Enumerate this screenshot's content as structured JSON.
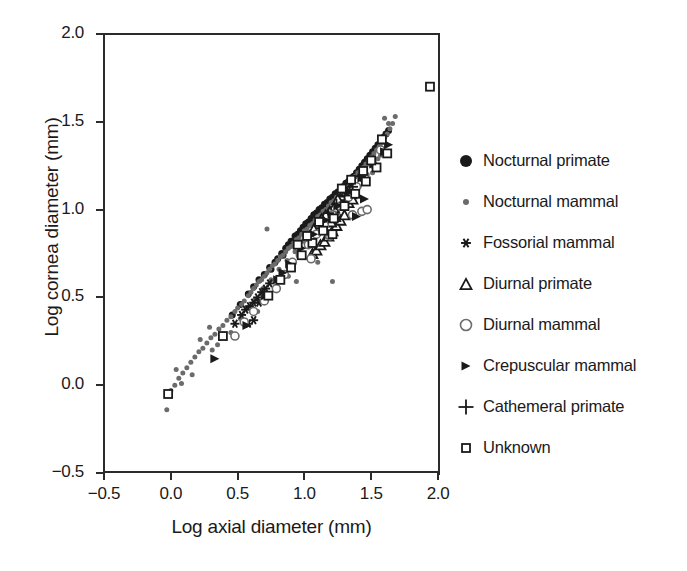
{
  "chart_data": {
    "type": "scatter",
    "title": "",
    "xlabel": "Log axial diameter (mm)",
    "ylabel": "Log cornea diameter (mm)",
    "xlim": [
      -0.5,
      2.0
    ],
    "ylim": [
      -0.5,
      2.0
    ],
    "xticks": [
      "-0.5",
      "0.0",
      "0.5",
      "1.0",
      "1.5",
      "2.0"
    ],
    "xtick_values": [
      -0.5,
      0.0,
      0.5,
      1.0,
      1.5,
      2.0
    ],
    "yticks": [
      "-0.5",
      "0.0",
      "0.5",
      "1.0",
      "1.5",
      "2.0"
    ],
    "ytick_values": [
      -0.5,
      0.0,
      0.5,
      1.0,
      1.5,
      2.0
    ],
    "grid": false,
    "legend_position": "right",
    "series": [
      {
        "name": "Nocturnal primate",
        "marker": "filled-circle",
        "color": "#1a1a1a",
        "size": 7,
        "points": [
          [
            0.46,
            0.4
          ],
          [
            0.52,
            0.46
          ],
          [
            0.58,
            0.52
          ],
          [
            0.62,
            0.56
          ],
          [
            0.66,
            0.6
          ],
          [
            0.7,
            0.63
          ],
          [
            0.74,
            0.67
          ],
          [
            0.78,
            0.7
          ],
          [
            0.8,
            0.72
          ],
          [
            0.83,
            0.75
          ],
          [
            0.86,
            0.78
          ],
          [
            0.88,
            0.8
          ],
          [
            0.9,
            0.82
          ],
          [
            0.93,
            0.85
          ],
          [
            0.95,
            0.86
          ],
          [
            0.97,
            0.88
          ],
          [
            0.99,
            0.9
          ],
          [
            1.01,
            0.92
          ],
          [
            1.03,
            0.93
          ],
          [
            1.05,
            0.95
          ],
          [
            1.07,
            0.97
          ],
          [
            1.09,
            0.98
          ],
          [
            1.11,
            1.0
          ],
          [
            1.13,
            1.01
          ],
          [
            1.15,
            1.03
          ],
          [
            1.17,
            1.04
          ],
          [
            1.19,
            1.06
          ],
          [
            1.21,
            1.07
          ],
          [
            1.23,
            1.09
          ],
          [
            1.25,
            1.1
          ],
          [
            1.27,
            1.12
          ],
          [
            1.29,
            1.13
          ],
          [
            1.31,
            1.15
          ],
          [
            1.33,
            1.16
          ],
          [
            1.35,
            1.18
          ],
          [
            1.37,
            1.19
          ],
          [
            1.39,
            1.21
          ],
          [
            1.41,
            1.23
          ],
          [
            1.43,
            1.25
          ],
          [
            1.45,
            1.27
          ],
          [
            1.47,
            1.29
          ],
          [
            1.49,
            1.31
          ],
          [
            1.51,
            1.33
          ],
          [
            1.53,
            1.35
          ],
          [
            1.55,
            1.37
          ],
          [
            1.57,
            1.39
          ],
          [
            1.59,
            1.41
          ],
          [
            1.61,
            1.43
          ],
          [
            1.63,
            1.45
          ],
          [
            1.12,
            0.95
          ],
          [
            1.18,
            1.0
          ],
          [
            1.24,
            1.05
          ],
          [
            1.3,
            1.1
          ],
          [
            1.36,
            1.14
          ],
          [
            1.42,
            1.2
          ],
          [
            0.75,
            0.66
          ],
          [
            0.84,
            0.74
          ],
          [
            0.92,
            0.81
          ],
          [
            1.0,
            0.89
          ],
          [
            1.08,
            0.96
          ]
        ]
      },
      {
        "name": "Nocturnal mammal",
        "marker": "small-filled-circle",
        "color": "#6b6b6b",
        "size": 5,
        "points": [
          [
            -0.03,
            -0.14
          ],
          [
            -0.02,
            -0.06
          ],
          [
            0.0,
            -0.03
          ],
          [
            0.03,
            0.0
          ],
          [
            0.06,
            0.04
          ],
          [
            0.09,
            0.07
          ],
          [
            0.12,
            0.1
          ],
          [
            0.15,
            0.13
          ],
          [
            0.18,
            0.16
          ],
          [
            0.21,
            0.19
          ],
          [
            0.24,
            0.21
          ],
          [
            0.27,
            0.24
          ],
          [
            0.3,
            0.27
          ],
          [
            0.33,
            0.29
          ],
          [
            0.36,
            0.32
          ],
          [
            0.39,
            0.34
          ],
          [
            0.42,
            0.37
          ],
          [
            0.45,
            0.39
          ],
          [
            0.48,
            0.42
          ],
          [
            0.5,
            0.44
          ],
          [
            0.53,
            0.46
          ],
          [
            0.55,
            0.48
          ],
          [
            0.58,
            0.51
          ],
          [
            0.6,
            0.53
          ],
          [
            0.62,
            0.55
          ],
          [
            0.64,
            0.57
          ],
          [
            0.66,
            0.59
          ],
          [
            0.68,
            0.6
          ],
          [
            0.7,
            0.62
          ],
          [
            0.72,
            0.64
          ],
          [
            0.74,
            0.66
          ],
          [
            0.76,
            0.68
          ],
          [
            0.78,
            0.69
          ],
          [
            0.8,
            0.71
          ],
          [
            0.82,
            0.73
          ],
          [
            0.84,
            0.74
          ],
          [
            0.86,
            0.76
          ],
          [
            0.88,
            0.78
          ],
          [
            0.9,
            0.79
          ],
          [
            0.92,
            0.81
          ],
          [
            0.94,
            0.83
          ],
          [
            0.96,
            0.84
          ],
          [
            0.98,
            0.86
          ],
          [
            1.0,
            0.88
          ],
          [
            1.02,
            0.89
          ],
          [
            1.04,
            0.91
          ],
          [
            1.06,
            0.92
          ],
          [
            1.08,
            0.94
          ],
          [
            1.1,
            0.96
          ],
          [
            1.12,
            0.97
          ],
          [
            1.14,
            0.99
          ],
          [
            1.16,
            1.0
          ],
          [
            1.18,
            1.02
          ],
          [
            1.2,
            1.04
          ],
          [
            1.22,
            1.05
          ],
          [
            1.24,
            1.07
          ],
          [
            1.26,
            1.08
          ],
          [
            1.28,
            1.1
          ],
          [
            1.3,
            1.12
          ],
          [
            1.32,
            1.13
          ],
          [
            1.34,
            1.15
          ],
          [
            1.36,
            1.17
          ],
          [
            1.38,
            1.19
          ],
          [
            1.4,
            1.21
          ],
          [
            1.42,
            1.22
          ],
          [
            1.44,
            1.24
          ],
          [
            1.46,
            1.26
          ],
          [
            1.48,
            1.28
          ],
          [
            1.5,
            1.3
          ],
          [
            1.52,
            1.32
          ],
          [
            1.54,
            1.34
          ],
          [
            1.56,
            1.36
          ],
          [
            1.58,
            1.38
          ],
          [
            1.6,
            1.41
          ],
          [
            1.62,
            1.43
          ],
          [
            1.64,
            1.46
          ],
          [
            1.66,
            1.49
          ],
          [
            1.68,
            1.53
          ],
          [
            1.6,
            1.52
          ],
          [
            1.63,
            1.49
          ],
          [
            0.31,
            0.2
          ],
          [
            0.35,
            0.23
          ],
          [
            0.45,
            0.3
          ],
          [
            0.52,
            0.38
          ],
          [
            0.57,
            0.44
          ],
          [
            0.63,
            0.49
          ],
          [
            0.69,
            0.55
          ],
          [
            0.75,
            0.6
          ],
          [
            0.81,
            0.66
          ],
          [
            0.87,
            0.71
          ],
          [
            0.93,
            0.76
          ],
          [
            0.99,
            0.82
          ],
          [
            1.05,
            0.87
          ],
          [
            1.11,
            0.92
          ],
          [
            1.17,
            0.97
          ],
          [
            0.72,
            0.89
          ],
          [
            0.88,
            0.62
          ],
          [
            0.94,
            0.59
          ],
          [
            1.21,
            0.59
          ],
          [
            1.33,
            1.05
          ],
          [
            1.41,
            1.13
          ],
          [
            1.47,
            1.2
          ],
          [
            1.55,
            1.29
          ],
          [
            1.1,
            0.7
          ],
          [
            0.65,
            0.42
          ],
          [
            0.29,
            0.33
          ],
          [
            0.22,
            0.26
          ],
          [
            0.16,
            0.06
          ],
          [
            0.08,
            0.01
          ],
          [
            0.04,
            0.09
          ],
          [
            1.51,
            1.21
          ],
          [
            1.57,
            1.31
          ],
          [
            1.35,
            1.09
          ],
          [
            1.25,
            0.98
          ],
          [
            1.15,
            0.89
          ]
        ]
      },
      {
        "name": "Fossorial mammal",
        "marker": "asterisk",
        "color": "#1a1a1a",
        "size": 9,
        "points": [
          [
            0.53,
            0.4
          ],
          [
            0.56,
            0.43
          ],
          [
            0.59,
            0.45
          ],
          [
            0.62,
            0.47
          ],
          [
            0.65,
            0.5
          ],
          [
            0.68,
            0.53
          ],
          [
            0.71,
            0.55
          ],
          [
            0.62,
            0.37
          ],
          [
            0.58,
            0.35
          ],
          [
            0.48,
            0.35
          ],
          [
            0.74,
            0.58
          ],
          [
            0.66,
            0.47
          ]
        ]
      },
      {
        "name": "Diurnal primate",
        "marker": "open-triangle",
        "color": "#1a1a1a",
        "size": 10,
        "points": [
          [
            1.06,
            0.75
          ],
          [
            1.09,
            0.77
          ],
          [
            1.12,
            0.8
          ],
          [
            1.15,
            0.82
          ],
          [
            1.18,
            0.85
          ],
          [
            1.21,
            0.88
          ],
          [
            1.24,
            0.91
          ],
          [
            1.27,
            0.94
          ],
          [
            1.3,
            0.97
          ],
          [
            1.26,
            1.03
          ],
          [
            1.29,
            1.05
          ],
          [
            1.32,
            1.07
          ],
          [
            1.35,
            1.09
          ],
          [
            1.22,
            1.01
          ],
          [
            1.19,
            0.99
          ],
          [
            1.16,
            0.97
          ],
          [
            1.13,
            0.95
          ],
          [
            1.28,
            1.08
          ],
          [
            1.31,
            1.1
          ],
          [
            1.34,
            1.12
          ],
          [
            1.37,
            1.14
          ],
          [
            1.25,
            1.06
          ],
          [
            1.1,
            0.92
          ],
          [
            1.07,
            0.89
          ],
          [
            1.33,
            1.04
          ],
          [
            1.36,
            1.06
          ],
          [
            1.23,
            0.96
          ],
          [
            1.2,
            0.93
          ]
        ]
      },
      {
        "name": "Diurnal mammal",
        "marker": "open-circle",
        "color": "#6b6b6b",
        "size": 8,
        "points": [
          [
            0.48,
            0.28
          ],
          [
            0.62,
            0.42
          ],
          [
            0.79,
            0.55
          ],
          [
            0.85,
            0.63
          ],
          [
            0.91,
            0.7
          ],
          [
            0.97,
            0.74
          ],
          [
            1.03,
            0.8
          ],
          [
            1.09,
            0.86
          ],
          [
            1.15,
            0.91
          ],
          [
            1.21,
            0.97
          ],
          [
            1.27,
            1.02
          ],
          [
            1.33,
            1.07
          ],
          [
            1.39,
            1.13
          ],
          [
            1.45,
            1.19
          ],
          [
            1.51,
            1.26
          ],
          [
            1.57,
            1.34
          ],
          [
            1.43,
            0.99
          ],
          [
            1.47,
            1.0
          ],
          [
            1.19,
            0.85
          ],
          [
            1.05,
            0.72
          ],
          [
            0.7,
            0.48
          ],
          [
            0.55,
            0.36
          ],
          [
            1.36,
            0.97
          ]
        ]
      },
      {
        "name": "Crepuscular mammal",
        "marker": "right-triangle",
        "color": "#1a1a1a",
        "size": 9,
        "points": [
          [
            0.33,
            0.15
          ],
          [
            0.57,
            0.34
          ],
          [
            0.71,
            0.51
          ],
          [
            0.8,
            0.6
          ],
          [
            0.89,
            0.69
          ],
          [
            0.98,
            0.78
          ],
          [
            1.07,
            0.86
          ],
          [
            1.16,
            0.94
          ],
          [
            1.25,
            1.02
          ],
          [
            1.34,
            1.1
          ],
          [
            1.43,
            1.18
          ],
          [
            1.52,
            1.26
          ],
          [
            1.39,
            0.96
          ],
          [
            1.45,
            1.06
          ],
          [
            1.6,
            1.33
          ],
          [
            1.63,
            1.37
          ],
          [
            0.84,
            0.64
          ]
        ]
      },
      {
        "name": "Cathemeral primate",
        "marker": "plus",
        "color": "#1a1a1a",
        "size": 11,
        "points": [
          [
            1.18,
            0.98
          ],
          [
            1.24,
            1.03
          ],
          [
            1.3,
            1.08
          ],
          [
            1.36,
            1.13
          ],
          [
            1.42,
            1.19
          ]
        ]
      },
      {
        "name": "Unknown",
        "marker": "open-square",
        "color": "#1a1a1a",
        "size": 8,
        "points": [
          [
            -0.02,
            -0.05
          ],
          [
            0.39,
            0.28
          ],
          [
            0.73,
            0.51
          ],
          [
            0.82,
            0.6
          ],
          [
            0.9,
            0.67
          ],
          [
            0.98,
            0.74
          ],
          [
            1.06,
            0.81
          ],
          [
            1.14,
            0.88
          ],
          [
            1.22,
            0.95
          ],
          [
            1.3,
            1.02
          ],
          [
            1.38,
            1.09
          ],
          [
            1.46,
            1.16
          ],
          [
            1.54,
            1.24
          ],
          [
            1.62,
            1.32
          ],
          [
            1.58,
            1.4
          ],
          [
            1.94,
            1.7
          ],
          [
            1.21,
            0.86
          ],
          [
            1.11,
            0.93
          ],
          [
            1.35,
            1.17
          ],
          [
            1.44,
            1.22
          ],
          [
            1.5,
            1.28
          ],
          [
            0.95,
            0.8
          ],
          [
            1.02,
            0.85
          ],
          [
            1.28,
            1.12
          ]
        ]
      }
    ]
  },
  "legend": {
    "items": [
      {
        "label": "Nocturnal primate",
        "marker": "filled-circle",
        "color": "#1a1a1a"
      },
      {
        "label": "Nocturnal mammal",
        "marker": "small-filled-circle",
        "color": "#6b6b6b"
      },
      {
        "label": "Fossorial mammal",
        "marker": "asterisk",
        "color": "#1a1a1a"
      },
      {
        "label": "Diurnal primate",
        "marker": "open-triangle",
        "color": "#1a1a1a"
      },
      {
        "label": "Diurnal mammal",
        "marker": "open-circle",
        "color": "#6b6b6b"
      },
      {
        "label": "Crepuscular mammal",
        "marker": "right-triangle",
        "color": "#1a1a1a"
      },
      {
        "label": "Cathemeral primate",
        "marker": "plus",
        "color": "#1a1a1a"
      },
      {
        "label": "Unknown",
        "marker": "open-square",
        "color": "#1a1a1a"
      }
    ]
  }
}
